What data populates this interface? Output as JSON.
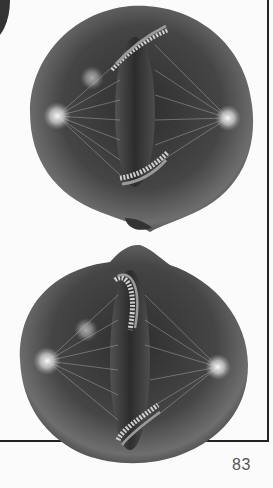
{
  "page": {
    "page_number": "83",
    "figures": [
      {
        "name": "cell-top",
        "description": "Cell in metaphase/anaphase with spindle fibers and chromosomes"
      },
      {
        "name": "cell-bottom",
        "description": "Cell in metaphase/anaphase with spindle fibers and chromosomes"
      }
    ],
    "colors": {
      "cell_body": "#4a4a4a",
      "cell_highlight": "#8a8a8a",
      "centrosome": "#e8e8e8",
      "frame": "#222222",
      "page_number": "#555555"
    }
  }
}
